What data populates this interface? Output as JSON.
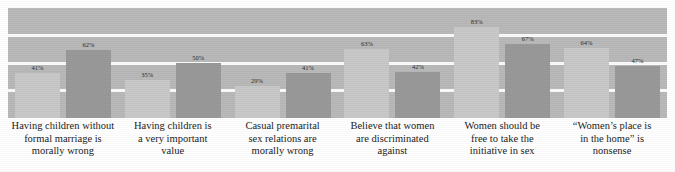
{
  "chart_data": {
    "type": "bar",
    "title": "",
    "subtitle": "",
    "xlabel": "",
    "ylabel": "",
    "ylim": [
      0,
      100
    ],
    "grid": true,
    "gridlines": [
      "75",
      "50",
      "25"
    ],
    "legend": "none",
    "legend_position": "none",
    "orientation": "vertical",
    "value_suffix": "%",
    "colors": {
      "panel_background": "#b9b9b9",
      "gridline": "#fbfbfb",
      "series_1": "#c9c9c9",
      "series_2": "#999999",
      "label_text": "#1c1c1c",
      "value_text": "#2b2b2b",
      "page_background": "#ffffff"
    },
    "categories": [
      "Having children without formal marriage is morally wrong",
      "Having children is a very important value",
      "Casual premarital sex relations are morally wrong",
      "Believe that women are discriminated against",
      "Women should be free to take the initiative in sex",
      "“Women’s place is in the home” is nonsense"
    ],
    "category_lines": [
      [
        "Having children without",
        "formal marriage is",
        "morally wrong"
      ],
      [
        "Having children is",
        "a very important",
        "value"
      ],
      [
        "Casual premarital",
        "sex relations are",
        "morally wrong"
      ],
      [
        "Believe that women",
        "are discriminated",
        "against"
      ],
      [
        "Women should be",
        "free to take the",
        "initiative in sex"
      ],
      [
        "“Women’s place is",
        "in the home” is",
        "nonsense"
      ]
    ],
    "series": [
      {
        "name": "series-1",
        "color": "#c9c9c9",
        "values": [
          41,
          35,
          29,
          63,
          83,
          64
        ]
      },
      {
        "name": "series-2",
        "color": "#999999",
        "values": [
          62,
          50,
          41,
          42,
          67,
          47
        ]
      }
    ],
    "value_labels": [
      [
        "41%",
        "62%"
      ],
      [
        "35%",
        "50%"
      ],
      [
        "29%",
        "41%"
      ],
      [
        "63%",
        "42%"
      ],
      [
        "83%",
        "67%"
      ],
      [
        "64%",
        "47%"
      ]
    ],
    "bars": [
      {
        "group": 0,
        "series": 0,
        "label": "41%",
        "value": 41
      },
      {
        "group": 0,
        "series": 1,
        "label": "62%",
        "value": 62
      },
      {
        "group": 1,
        "series": 0,
        "label": "35%",
        "value": 35
      },
      {
        "group": 1,
        "series": 1,
        "label": "50%",
        "value": 50
      },
      {
        "group": 2,
        "series": 0,
        "label": "29%",
        "value": 29
      },
      {
        "group": 2,
        "series": 1,
        "label": "41%",
        "value": 41
      },
      {
        "group": 3,
        "series": 0,
        "label": "63%",
        "value": 63
      },
      {
        "group": 3,
        "series": 1,
        "label": "42%",
        "value": 42
      },
      {
        "group": 4,
        "series": 0,
        "label": "83%",
        "value": 83
      },
      {
        "group": 4,
        "series": 1,
        "label": "67%",
        "value": 67
      },
      {
        "group": 5,
        "series": 0,
        "label": "64%",
        "value": 64
      },
      {
        "group": 5,
        "series": 1,
        "label": "47%",
        "value": 47
      }
    ]
  },
  "layout": {
    "panel": {
      "left": 8,
      "top": 8,
      "width": 659,
      "height": 110
    },
    "group_centers": [
      70,
      188,
      305,
      422,
      540,
      612
    ],
    "bar_width": 45,
    "bar_gap": 6
  }
}
